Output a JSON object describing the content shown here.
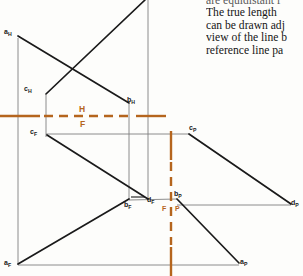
{
  "page": {
    "width": 303,
    "height": 276,
    "background": "#fdfdfb"
  },
  "body_text": {
    "lines": [
      "are equidistant f",
      "The true length",
      "can be drawn adj",
      "view of the line b",
      "reference line pa"
    ]
  },
  "colors": {
    "line_black": "#1a1a1a",
    "line_gray": "#777777",
    "reference_orange": "#b5651d",
    "label_black": "#1a1a1a"
  },
  "drawing": {
    "title": "orthographic-projection-three-views",
    "reference_lines": {
      "hf_label_top": "H",
      "hf_label_bottom": "F",
      "fp_label_left": "F",
      "fp_label_right": "P"
    },
    "points": [
      {
        "id": "a_H",
        "base": "a",
        "view": "H",
        "label": "a",
        "sub": "H",
        "x": 18,
        "y": 35,
        "lx": 5,
        "ly": 30
      },
      {
        "id": "c_H",
        "base": "c",
        "view": "H",
        "label": "c",
        "sub": "H",
        "x": 46,
        "y": 92,
        "lx": 24,
        "ly": 88
      },
      {
        "id": "b_H",
        "base": "b",
        "view": "H",
        "label": "b",
        "sub": "H",
        "x": 129,
        "y": 103,
        "lx": 128,
        "ly": 99
      },
      {
        "id": "c_F",
        "base": "c",
        "view": "F",
        "label": "c",
        "sub": "F",
        "x": 46,
        "y": 134,
        "lx": 31,
        "ly": 131
      },
      {
        "id": "c_P",
        "base": "c",
        "view": "P",
        "label": "c",
        "sub": "P",
        "x": 189,
        "y": 134,
        "lx": 190,
        "ly": 126
      },
      {
        "id": "b_F",
        "base": "b",
        "view": "F",
        "label": "b",
        "sub": "F",
        "x": 129,
        "y": 200,
        "lx": 125,
        "ly": 203
      },
      {
        "id": "d_F",
        "base": "d",
        "view": "F",
        "label": "d",
        "sub": "F",
        "x": 148,
        "y": 200,
        "lx": 148,
        "ly": 200
      },
      {
        "id": "b_P",
        "base": "b",
        "view": "P",
        "label": "b",
        "sub": "P",
        "x": 177,
        "y": 198,
        "lx": 175,
        "ly": 193
      },
      {
        "id": "d_P",
        "base": "d",
        "view": "P",
        "label": "d",
        "sub": "P",
        "x": 293,
        "y": 205,
        "lx": 291,
        "ly": 201
      },
      {
        "id": "a_F",
        "base": "a",
        "view": "F",
        "label": "a",
        "sub": "F",
        "x": 18,
        "y": 265,
        "lx": 5,
        "ly": 262
      },
      {
        "id": "a_P",
        "base": "a",
        "view": "P",
        "label": "a",
        "sub": "P",
        "x": 239,
        "y": 264,
        "lx": 240,
        "ly": 261
      }
    ],
    "edges": [
      {
        "name": "ab-top-view",
        "from": "a_H",
        "to": "b_H",
        "style": "solid-black"
      },
      {
        "name": "cd-top-view",
        "from": "c_H",
        "to": "d_H",
        "style": "solid-black"
      },
      {
        "name": "ab-front-view",
        "from": "a_F",
        "to": "b_F",
        "style": "solid-black"
      },
      {
        "name": "cd-front-view",
        "from": "c_F",
        "to": "d_F",
        "style": "solid-black"
      },
      {
        "name": "ab-profile-view",
        "from": "b_P",
        "to": "a_P",
        "style": "solid-black"
      },
      {
        "name": "cd-profile-view",
        "from": "c_P",
        "to": "d_P",
        "style": "solid-black"
      }
    ],
    "projectors": [
      {
        "name": "projector-a-vertical",
        "style": "thin-gray"
      },
      {
        "name": "projector-c-vertical",
        "style": "thin-gray"
      },
      {
        "name": "projector-b-vertical",
        "style": "thin-gray"
      },
      {
        "name": "projector-d-vertical",
        "style": "thin-gray"
      },
      {
        "name": "projector-c-horizontal",
        "style": "thin-gray"
      },
      {
        "name": "projector-b-horizontal",
        "style": "thin-gray"
      },
      {
        "name": "projector-a-horizontal",
        "style": "thin-gray"
      }
    ]
  }
}
